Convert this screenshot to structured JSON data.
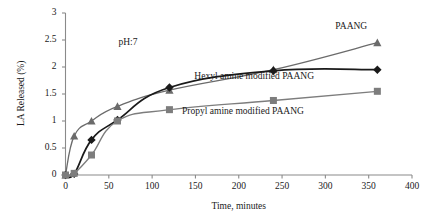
{
  "chart_data": {
    "type": "line",
    "title": "",
    "subtitle": "",
    "xlabel": "Time, minutes",
    "ylabel": "LA Released (%)",
    "xlim": [
      0,
      400
    ],
    "ylim": [
      0,
      3
    ],
    "xticks": [
      0,
      50,
      100,
      150,
      200,
      250,
      300,
      350,
      400
    ],
    "yticks": [
      0,
      0.5,
      1,
      1.5,
      2,
      2.5,
      3
    ],
    "grid": false,
    "legend_position": "inline-annotations",
    "annotations": [
      {
        "text": "pH:7",
        "x": 75,
        "y": 2.45
      }
    ],
    "series": [
      {
        "name": "PAANG",
        "marker": "triangle",
        "color": "#6b6b6b",
        "label_x": 330,
        "label_y": 2.75,
        "x": [
          0,
          10,
          30,
          60,
          120,
          240,
          360
        ],
        "y": [
          0,
          0.72,
          1.0,
          1.27,
          1.57,
          1.95,
          2.45
        ]
      },
      {
        "name": "Hexyl amine modified PAANG",
        "marker": "diamond",
        "color": "#1a1a1a",
        "label_x": 218,
        "label_y": 1.82,
        "x": [
          0,
          10,
          30,
          60,
          120,
          240,
          360
        ],
        "y": [
          0,
          0.02,
          0.65,
          1.02,
          1.62,
          1.93,
          1.95
        ]
      },
      {
        "name": "Propyl amine modified PAANG",
        "marker": "square",
        "color": "#7d7d7d",
        "label_x": 205,
        "label_y": 1.16,
        "x": [
          0,
          10,
          30,
          60,
          120,
          240,
          360
        ],
        "y": [
          0,
          0.03,
          0.37,
          1.0,
          1.21,
          1.38,
          1.55
        ]
      }
    ]
  },
  "axis": {
    "x_title": "Time, minutes",
    "y_title": "LA Released (%)",
    "x_tick_labels": [
      "0",
      "50",
      "100",
      "150",
      "200",
      "250",
      "300",
      "350",
      "400"
    ],
    "y_tick_labels": [
      "0",
      "0.5",
      "1",
      "1.5",
      "2",
      "2.5",
      "3"
    ]
  },
  "annotation": {
    "ph": "pH:7"
  },
  "series_labels": {
    "paang": "PAANG",
    "hexyl": "Hexyl amine modified PAANG",
    "propyl": "Propyl amine modified PAANG"
  },
  "colors": {
    "paang": "#6b6b6b",
    "hexyl": "#1a1a1a",
    "propyl": "#7d7d7d",
    "axis": "#8a8a8a",
    "background": "#ffffff"
  }
}
